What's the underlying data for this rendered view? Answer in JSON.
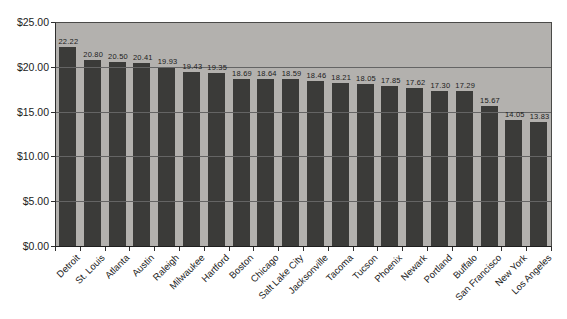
{
  "chart_data": {
    "type": "bar",
    "title": "",
    "xlabel": "",
    "ylabel": "",
    "categories": [
      "Detroit",
      "St. Louis",
      "Atlanta",
      "Austin",
      "Raleigh",
      "Milwaukee",
      "Hartford",
      "Boston",
      "Chicago",
      "Salt Lake City",
      "Jacksonville",
      "Tacoma",
      "Tucson",
      "Phoenix",
      "Newark",
      "Portland",
      "Buffalo",
      "San Francisco",
      "New York",
      "Los Angeles"
    ],
    "values": [
      22.22,
      20.8,
      20.5,
      20.41,
      19.93,
      19.43,
      19.35,
      18.69,
      18.64,
      18.59,
      18.46,
      18.21,
      18.05,
      17.85,
      17.62,
      17.3,
      17.29,
      15.67,
      14.05,
      13.83
    ],
    "value_labels": [
      "22.22",
      "20.80",
      "20.50",
      "20.41",
      "19.93",
      "19.43",
      "19.35",
      "18.69",
      "18.64",
      "18.59",
      "18.46",
      "18.21",
      "18.05",
      "17.85",
      "17.62",
      "17.30",
      "17.29",
      "15.67",
      "14.05",
      "13.83"
    ],
    "ylim": [
      0,
      25
    ],
    "yticks": [
      25,
      20,
      15,
      10,
      5,
      0
    ],
    "ytick_labels": [
      "$25.00",
      "$20.00",
      "$15.00",
      "$10.00",
      "$5.00",
      "$0.00"
    ],
    "grid": true,
    "legend": false,
    "data_labels": true,
    "colors": {
      "bar": "#3b3b39",
      "plot_background": "#b3b1ae",
      "gridline": "#646464",
      "axis": "#2e2e2e",
      "text": "#1c1c1c"
    }
  }
}
